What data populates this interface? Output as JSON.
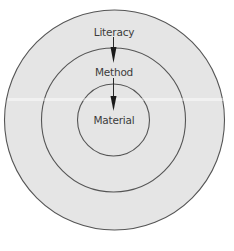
{
  "diagram": {
    "type": "concentric-circles",
    "layers": [
      {
        "id": "outer",
        "label": "Literacy"
      },
      {
        "id": "middle",
        "label": "Method"
      },
      {
        "id": "inner",
        "label": "Material"
      }
    ],
    "arrows": [
      {
        "from": "Literacy",
        "to": "Method"
      },
      {
        "from": "Method",
        "to": "Material"
      }
    ],
    "colors": {
      "fill": "#e5e5e5",
      "stroke": "#555555",
      "text": "#3c3c3c",
      "arrow": "#1a1a1a",
      "background": "#ffffff"
    }
  }
}
